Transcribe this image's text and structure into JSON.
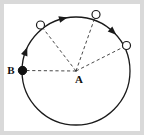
{
  "figure": {
    "background_color": "#ffffff",
    "frame_color": "#d9d9d9",
    "stroke_color": "#1a1a1a",
    "dash_color": "#333333"
  },
  "labels": {
    "center_point": "A",
    "start_point": "B"
  },
  "chart_data": {
    "type": "scatter",
    "xlabel": "",
    "ylabel": "",
    "geometry": {
      "circle": {
        "cx": 76,
        "cy": 71,
        "r": 54,
        "stroke_width": 1.3
      },
      "center": {
        "label": "A",
        "x": 76,
        "y": 71,
        "label_x": 79,
        "label_y": 83
      }
    },
    "points": [
      {
        "label": "B",
        "x": 22.5,
        "y": 70.5,
        "marker": "filled",
        "radius": 4.2,
        "angle_deg": 181,
        "label_x": 11,
        "label_y": 74
      },
      {
        "label": "",
        "x": 40.5,
        "y": 25.0,
        "marker": "open",
        "radius": 4.0,
        "angle_deg": 140
      },
      {
        "label": "",
        "x": 96.0,
        "y": 14.5,
        "marker": "open",
        "radius": 4.0,
        "angle_deg": 69
      },
      {
        "label": "",
        "x": 126.5,
        "y": 45.5,
        "marker": "open",
        "radius": 4.0,
        "angle_deg": 27
      }
    ],
    "radii": [
      {
        "from": "A",
        "to": "B",
        "style": "dashed"
      },
      {
        "from": "A",
        "to": "P1",
        "style": "dashed"
      },
      {
        "from": "A",
        "to": "P2",
        "style": "dashed"
      },
      {
        "from": "A",
        "to": "P3",
        "style": "dashed"
      }
    ],
    "arrows": [
      {
        "on": "circle-arc",
        "angle_deg": 104,
        "direction": "counterclockwise"
      },
      {
        "on": "circle-arc",
        "angle_deg": 47,
        "direction": "counterclockwise"
      },
      {
        "on": "circle-arc",
        "angle_deg": 159,
        "direction": "counterclockwise"
      }
    ],
    "legend": [],
    "grid": false
  }
}
